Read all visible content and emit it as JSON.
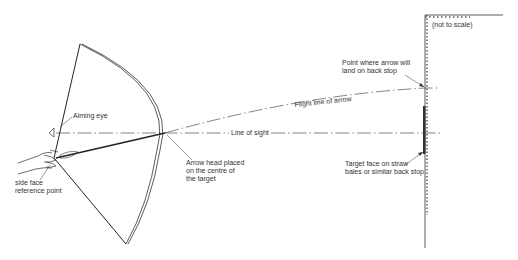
{
  "diagram": {
    "note": "(not to scale)",
    "labels": {
      "aiming_eye": "Aiming eye",
      "reference_point": "side face\nreference point",
      "arrow_head": "Arrow head placed\non the centre of\nthe target",
      "line_of_sight": "Line of sight",
      "flight_line": "Flight line of arrow",
      "landing_point": "Point where arrow will\nland on back stop",
      "target_face": "Target face on straw\nbales or similar back stop"
    },
    "colors": {
      "line": "#222222",
      "text": "#333333",
      "background": "#ffffff"
    }
  }
}
